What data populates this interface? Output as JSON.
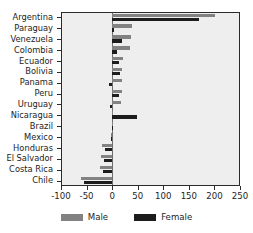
{
  "chart_data": {
    "type": "bar",
    "orientation": "horizontal",
    "title": "",
    "xlabel": "",
    "ylabel": "",
    "xlim": [
      -100,
      250
    ],
    "xticks": [
      -100,
      -50,
      0,
      50,
      100,
      150,
      200,
      250
    ],
    "xticklabels": [
      "-100",
      "-50",
      "0",
      "50",
      "100",
      "150",
      "200",
      "250"
    ],
    "grid": false,
    "legend_position": "bottom-center",
    "zero_reference_line": true,
    "categories": [
      "Argentina",
      "Paraguay",
      "Venezuela",
      "Colombia",
      "Ecuador",
      "Bolivia",
      "Panama",
      "Peru",
      "Uruguay",
      "Nicaragua",
      "Brazil",
      "Mexico",
      "Honduras",
      "El Salvador",
      "Costa Rica",
      "Chile"
    ],
    "series": [
      {
        "name": "Male",
        "color": "#828282",
        "values": [
          201,
          38,
          36,
          34,
          21,
          20,
          20,
          19,
          18,
          2,
          1,
          -2,
          -20,
          -22,
          -24,
          -60
        ]
      },
      {
        "name": "Female",
        "color": "#1c1c1c",
        "values": [
          170,
          4,
          19,
          9,
          14,
          16,
          -6,
          13,
          -4,
          48,
          1,
          -2,
          -13,
          -16,
          -18,
          -55
        ]
      }
    ]
  },
  "legend": {
    "items": [
      {
        "label": "Male",
        "color": "#828282"
      },
      {
        "label": "Female",
        "color": "#1c1c1c"
      }
    ]
  }
}
